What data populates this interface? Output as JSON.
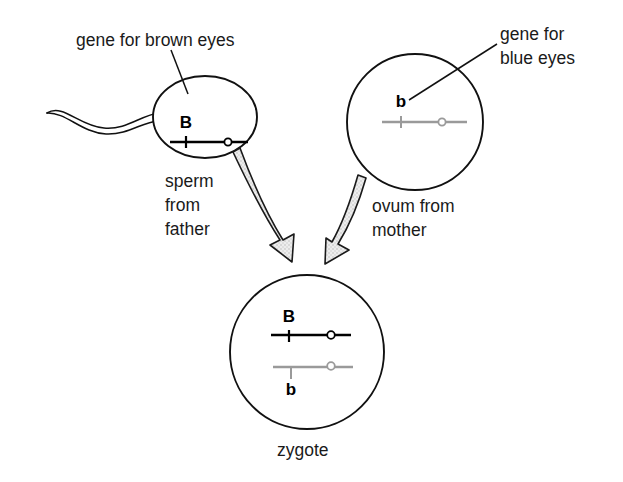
{
  "diagram": {
    "background_color": "#ffffff"
  },
  "annotations": {
    "brown_gene_label": "gene for brown eyes",
    "blue_gene_label_line1": "gene for",
    "blue_gene_label_line2": "blue eyes"
  },
  "cells": {
    "sperm": {
      "name": "sperm",
      "label_line1": "sperm",
      "label_line2": "from",
      "label_line3": "father",
      "allele": "B",
      "allele_meaning": "brown eyes",
      "chromosome_color": "#000000",
      "shape": "ellipse"
    },
    "ovum": {
      "name": "ovum",
      "label_line1": "ovum from",
      "label_line2": "mother",
      "allele": "b",
      "allele_meaning": "blue eyes",
      "chromosome_color": "#9a9a9a",
      "shape": "circle"
    },
    "zygote": {
      "name": "zygote",
      "label": "zygote",
      "allele_paternal": "B",
      "allele_maternal": "b",
      "genotype": "Bb",
      "chromosome_color_paternal": "#000000",
      "chromosome_color_maternal": "#9a9a9a",
      "shape": "circle"
    }
  },
  "arrows": {
    "sperm_to_zygote": "fertilization-arrow",
    "ovum_to_zygote": "fertilization-arrow",
    "fill_color": "#e2e2e2",
    "outline_color": "#1a1a1a"
  }
}
